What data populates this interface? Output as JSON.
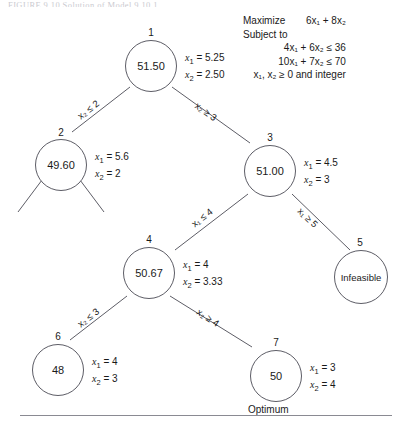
{
  "figure": {
    "caption_partial": "FIGURE 9.10   Solution of Model 9.10.1",
    "optimum_label": "Optimum"
  },
  "model": {
    "objective_label": "Maximize",
    "objective_expr": "6x₁  +  8x₂",
    "subject_label": "Subject to",
    "constraints": [
      "4x₁  +  6x₂  ≤  36",
      "10x₁  +  7x₂  ≤  70",
      "x₁, x₂  ≥  0 and integer"
    ]
  },
  "tree": {
    "nodes": [
      {
        "id": "1",
        "value": "51.50",
        "x1": "5.25",
        "x2": "2.50",
        "status": ""
      },
      {
        "id": "2",
        "value": "49.60",
        "x1": "5.6",
        "x2": "2",
        "status": ""
      },
      {
        "id": "3",
        "value": "51.00",
        "x1": "4.5",
        "x2": "3",
        "status": ""
      },
      {
        "id": "4",
        "value": "50.67",
        "x1": "4",
        "x2": "3.33",
        "status": ""
      },
      {
        "id": "5",
        "value": "Infeasible",
        "x1": "",
        "x2": "",
        "status": "infeasible"
      },
      {
        "id": "6",
        "value": "48",
        "x1": "4",
        "x2": "3",
        "status": ""
      },
      {
        "id": "7",
        "value": "50",
        "x1": "3",
        "x2": "4",
        "status": "optimum"
      }
    ],
    "edges": [
      {
        "from": "1",
        "to": "2",
        "label": "x₂ ≤ 2"
      },
      {
        "from": "1",
        "to": "3",
        "label": "x₂ ≥ 3"
      },
      {
        "from": "3",
        "to": "4",
        "label": "x₁ ≤ 4"
      },
      {
        "from": "3",
        "to": "5",
        "label": "x₁ ≥ 5"
      },
      {
        "from": "4",
        "to": "6",
        "label": "x₂ ≤ 3"
      },
      {
        "from": "4",
        "to": "7",
        "label": "x₂ ≥ 4"
      }
    ],
    "var_labels": {
      "x1": "x₁",
      "x2": "x₂",
      "equals": "="
    }
  },
  "colors": {
    "stroke": "#5d5d66",
    "text": "#1a1a1a",
    "background": "#ffffff"
  }
}
